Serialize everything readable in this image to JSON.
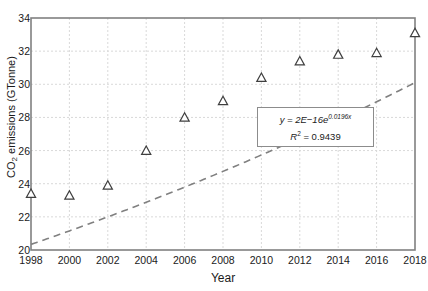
{
  "chart_data": {
    "type": "scatter",
    "title": "",
    "xlabel": "Year",
    "ylabel": "CO2 emissions (GTonne)",
    "ylabel_parts": {
      "prefix": "CO",
      "sub": "2",
      "suffix": " emissions (GTonne)"
    },
    "x": [
      1998,
      2000,
      2002,
      2004,
      2006,
      2008,
      2010,
      2012,
      2014,
      2016,
      2018
    ],
    "values": [
      23.4,
      23.3,
      23.9,
      26.0,
      28.0,
      29.0,
      30.4,
      31.4,
      31.8,
      31.9,
      33.1
    ],
    "series": [
      {
        "name": "CO2 emissions",
        "marker": "open-triangle",
        "marker_color": "#3f3f3f",
        "values": [
          23.4,
          23.3,
          23.9,
          26.0,
          28.0,
          29.0,
          30.4,
          31.4,
          31.8,
          31.9,
          33.1
        ]
      }
    ],
    "trendline": {
      "type": "exponential",
      "style": "dashed",
      "color": "#808080",
      "equation_label": "y = 2E−16e",
      "equation_exponent": "0.0196x",
      "r_squared_label": "R",
      "r_squared_sup": "2",
      "r_squared_value": "= 0.9439",
      "a": 2e-16,
      "b": 0.0196
    },
    "xlim": [
      1998,
      2018
    ],
    "ylim": [
      20,
      34
    ],
    "xticks": [
      1998,
      2000,
      2002,
      2004,
      2006,
      2008,
      2010,
      2012,
      2014,
      2016,
      2018
    ],
    "yticks": [
      20,
      22,
      24,
      26,
      28,
      30,
      32,
      34
    ],
    "grid": true,
    "grid_style": "dotted",
    "grid_color": "#d9d9d9",
    "legend": "none",
    "axis_color": "#808080",
    "plot_background": "#ffffff"
  }
}
